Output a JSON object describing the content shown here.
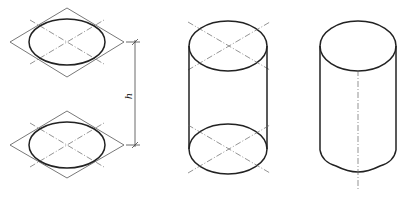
{
  "figure": {
    "top_caption_cropped": "",
    "stroke_color": "#222222",
    "thin_color": "#555555"
  },
  "step1": {
    "name": "rhombus-ellipse-pair",
    "top": {
      "center": [
        67,
        42
      ],
      "rhombus": [
        [
          67,
          8
        ],
        [
          124,
          42
        ],
        [
          67,
          77
        ],
        [
          10,
          42
        ]
      ],
      "ellipse_rx": 38,
      "ellipse_ry": 23
    },
    "bottom": {
      "center": [
        67,
        145
      ],
      "rhombus": [
        [
          67,
          111
        ],
        [
          124,
          145
        ],
        [
          67,
          178
        ],
        [
          10,
          145
        ]
      ],
      "ellipse_rx": 38,
      "ellipse_ry": 23
    },
    "dimension": {
      "x": 135,
      "y1": 42,
      "y2": 145,
      "label": "h"
    }
  },
  "step2": {
    "name": "cylinder-with-construction",
    "top_center": [
      228,
      46
    ],
    "bottom_center": [
      228,
      149
    ],
    "rx": 39,
    "ry": 25
  },
  "step3": {
    "name": "finished-cylinder",
    "top_center": [
      358,
      46
    ],
    "rx": 38,
    "ry": 25,
    "bottom_y": 172,
    "centerline": {
      "x": 358,
      "y1": 70,
      "y2": 190
    }
  }
}
